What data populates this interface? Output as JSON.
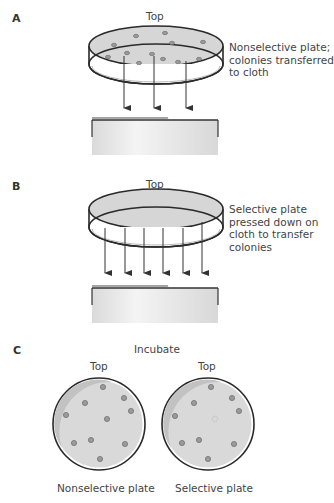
{
  "panels": [
    {
      "letter": "A",
      "top_label": "Top",
      "caption_lines": [
        "Nonselective plate;",
        "colonies transferred",
        "to cloth"
      ],
      "arrow_count": 3,
      "colony_count": 12
    },
    {
      "letter": "B",
      "top_label": "Top",
      "caption_lines": [
        "Selective plate",
        "pressed down on",
        "cloth to transfer",
        "colonies"
      ],
      "arrow_count": 6,
      "colony_count": 0
    },
    {
      "letter": "C",
      "step_label": "Incubate",
      "plates": [
        {
          "top_label": "Top",
          "name": "Nonselective plate",
          "colony_count": 10,
          "missing_colonies": 0
        },
        {
          "top_label": "Top",
          "name": "Selective plate",
          "colony_count": 9,
          "missing_colonies": 1
        }
      ]
    }
  ],
  "colors": {
    "outline": "#2a2a2a",
    "agar": "#d6d6d6",
    "agar_shadow": "#c4c4c4",
    "colony": "#9a9a9a",
    "cloth": "#e6e6e6",
    "arrow": "#333333"
  }
}
